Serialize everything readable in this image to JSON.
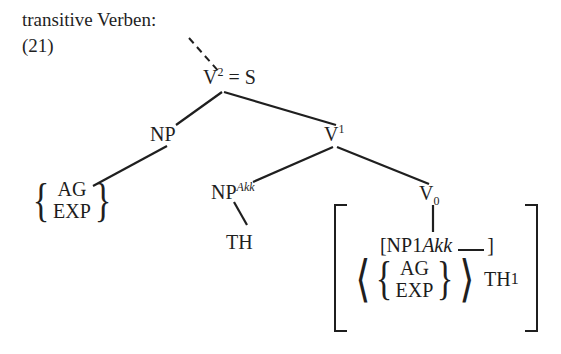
{
  "figure": {
    "caption": "transitive Verben:",
    "number": "(21)"
  },
  "tree": {
    "root": {
      "label": "V",
      "superscript": "2",
      "equals": "= S",
      "full": "V² = S"
    },
    "subject": {
      "label": "NP"
    },
    "subject_roles": {
      "top": "AG",
      "bottom": "EXP"
    },
    "vbar": {
      "label": "V",
      "superscript": "1",
      "full": "V¹"
    },
    "object": {
      "label": "NP",
      "superscript": "Akk",
      "full": "NPAkk"
    },
    "object_role": {
      "label": "TH"
    },
    "head": {
      "label": "V",
      "subscript": "0",
      "full": "V0"
    }
  },
  "lexical_entry": {
    "row1": {
      "open_bracket": "[",
      "category": "NP",
      "subscript": "1",
      "superscript": "Akk",
      "close_bracket": "]"
    },
    "row2": {
      "open_angle": "⟨",
      "roles_top": "AG",
      "roles_bottom": "EXP",
      "close_angle": "⟩",
      "theme": "TH",
      "theme_subscript": "1"
    },
    "brace_left": "{",
    "brace_right": "}"
  },
  "colors": {
    "ink": "#1f1f1f",
    "background": "#ffffff",
    "line": "#1f1f1f"
  }
}
